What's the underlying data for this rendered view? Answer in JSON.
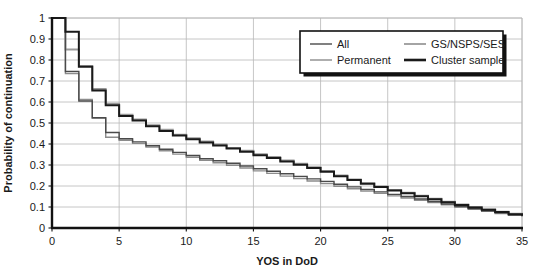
{
  "chart_data": {
    "type": "line",
    "subtype": "step",
    "title": "",
    "xlabel": "YOS in DoD",
    "ylabel": "Probability of continuation",
    "xlim": [
      0,
      35
    ],
    "ylim": [
      0,
      1
    ],
    "xticks": [
      0,
      5,
      10,
      15,
      20,
      25,
      30,
      35
    ],
    "xtick_labels": [
      "0",
      "5",
      "10",
      "15",
      "20",
      "25",
      "30",
      "35"
    ],
    "yticks": [
      0,
      0.1,
      0.2,
      0.3,
      0.4,
      0.5,
      0.6,
      0.7,
      0.8,
      0.9,
      1
    ],
    "ytick_labels": [
      "0",
      "0.1",
      "0.2",
      "0.3",
      "0.4",
      "0.5",
      "0.6",
      "0.7",
      "0.8",
      "0.9",
      "1"
    ],
    "grid": true,
    "grid_axis": "both",
    "legend_position": "upper-right",
    "x": [
      0,
      1,
      2,
      3,
      4,
      5,
      6,
      7,
      8,
      9,
      10,
      11,
      12,
      13,
      14,
      15,
      16,
      17,
      18,
      19,
      20,
      21,
      22,
      23,
      24,
      25,
      26,
      27,
      28,
      29,
      30,
      31,
      32,
      33,
      34,
      35
    ],
    "series": [
      {
        "name": "All",
        "color": "#4a4a4a",
        "width": 1.4,
        "values": [
          1.0,
          0.745,
          0.605,
          0.525,
          0.455,
          0.425,
          0.41,
          0.392,
          0.375,
          0.36,
          0.345,
          0.33,
          0.32,
          0.308,
          0.295,
          0.282,
          0.27,
          0.258,
          0.246,
          0.234,
          0.222,
          0.208,
          0.196,
          0.184,
          0.172,
          0.16,
          0.15,
          0.138,
          0.126,
          0.114,
          0.103,
          0.093,
          0.082,
          0.072,
          0.063,
          0.057
        ]
      },
      {
        "name": "Permanent",
        "color": "#8c8c8c",
        "width": 1.4,
        "values": [
          1.0,
          0.735,
          0.612,
          0.523,
          0.432,
          0.418,
          0.403,
          0.385,
          0.368,
          0.352,
          0.337,
          0.322,
          0.311,
          0.299,
          0.286,
          0.272,
          0.26,
          0.247,
          0.236,
          0.224,
          0.212,
          0.199,
          0.187,
          0.176,
          0.165,
          0.153,
          0.143,
          0.132,
          0.121,
          0.11,
          0.099,
          0.089,
          0.079,
          0.069,
          0.06,
          0.054
        ]
      },
      {
        "name": "GS/NSPS/SES",
        "color": "#9a9a9a",
        "width": 1.8,
        "values": [
          1.0,
          0.85,
          0.772,
          0.662,
          0.592,
          0.54,
          0.517,
          0.49,
          0.468,
          0.445,
          0.428,
          0.412,
          0.398,
          0.382,
          0.368,
          0.352,
          0.338,
          0.322,
          0.306,
          0.29,
          0.272,
          0.25,
          0.232,
          0.214,
          0.198,
          0.182,
          0.168,
          0.154,
          0.14,
          0.126,
          0.112,
          0.1,
          0.089,
          0.078,
          0.068,
          0.06
        ]
      },
      {
        "name": "Cluster sample",
        "color": "#1a1a1a",
        "width": 2.0,
        "values": [
          1.0,
          0.935,
          0.768,
          0.655,
          0.585,
          0.533,
          0.512,
          0.485,
          0.462,
          0.44,
          0.423,
          0.407,
          0.393,
          0.378,
          0.363,
          0.347,
          0.333,
          0.317,
          0.301,
          0.286,
          0.268,
          0.246,
          0.228,
          0.211,
          0.195,
          0.179,
          0.165,
          0.151,
          0.137,
          0.123,
          0.11,
          0.098,
          0.087,
          0.076,
          0.066,
          0.058
        ]
      }
    ],
    "legend": [
      {
        "label": "All",
        "color": "#4a4a4a",
        "width": 1.4
      },
      {
        "label": "GS/NSPS/SES",
        "color": "#9a9a9a",
        "width": 1.8
      },
      {
        "label": "Permanent",
        "color": "#8c8c8c",
        "width": 1.4
      },
      {
        "label": "Cluster sample",
        "color": "#1a1a1a",
        "width": 2.6
      }
    ]
  },
  "colors": {
    "background": "#ffffff",
    "axis": "#111111",
    "grid": "#b8b8b8",
    "text": "#1a1a1a",
    "legend_border": "#111111",
    "legend_shadow": "#111111",
    "legend_fill": "#ffffff"
  },
  "geometry": {
    "plot_left": 52,
    "plot_right": 522,
    "plot_top": 18,
    "plot_bottom": 228,
    "legend_x": 300,
    "legend_y": 31,
    "legend_w": 203,
    "legend_h": 42
  }
}
